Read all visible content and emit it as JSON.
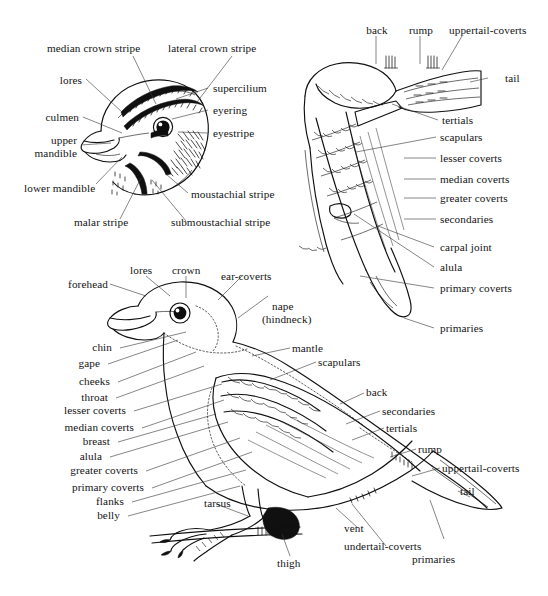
{
  "figure": {
    "kind": "bird-topography-diagram",
    "panels": [
      "head",
      "wing",
      "whole-body"
    ]
  },
  "head_panel": {
    "labels": [
      {
        "id": "median-crown-stripe",
        "text": "median crown stripe"
      },
      {
        "id": "lateral-crown-stripe",
        "text": "lateral crown stripe"
      },
      {
        "id": "lores",
        "text": "lores"
      },
      {
        "id": "supercilium",
        "text": "supercilium"
      },
      {
        "id": "culmen",
        "text": "culmen"
      },
      {
        "id": "eyering",
        "text": "eyering"
      },
      {
        "id": "eyestripe",
        "text": "eyestripe"
      },
      {
        "id": "upper-mandible",
        "text": "upper\nmandible"
      },
      {
        "id": "upper-mandible-l1",
        "text": "upper"
      },
      {
        "id": "upper-mandible-l2",
        "text": "mandible"
      },
      {
        "id": "lower-mandible",
        "text": "lower mandible"
      },
      {
        "id": "moustachial-stripe",
        "text": "moustachial stripe"
      },
      {
        "id": "malar-stripe",
        "text": "malar stripe"
      },
      {
        "id": "submoustachial-stripe",
        "text": "submoustachial stripe"
      }
    ]
  },
  "wing_panel": {
    "labels": [
      {
        "id": "back",
        "text": "back"
      },
      {
        "id": "rump",
        "text": "rump"
      },
      {
        "id": "uppertail-coverts",
        "text": "uppertail-coverts"
      },
      {
        "id": "tail",
        "text": "tail"
      },
      {
        "id": "tertials",
        "text": "tertials"
      },
      {
        "id": "scapulars",
        "text": "scapulars"
      },
      {
        "id": "lesser-coverts",
        "text": "lesser coverts"
      },
      {
        "id": "median-coverts",
        "text": "median coverts"
      },
      {
        "id": "greater-coverts",
        "text": "greater coverts"
      },
      {
        "id": "secondaries",
        "text": "secondaries"
      },
      {
        "id": "carpal-joint",
        "text": "carpal joint"
      },
      {
        "id": "alula",
        "text": "alula"
      },
      {
        "id": "primary-coverts",
        "text": "primary coverts"
      },
      {
        "id": "primaries",
        "text": "primaries"
      }
    ]
  },
  "body_panel": {
    "labels_top": [
      {
        "id": "lores",
        "text": "lores"
      },
      {
        "id": "crown",
        "text": "crown"
      },
      {
        "id": "forehead",
        "text": "forehead"
      },
      {
        "id": "ear-coverts",
        "text": "ear-coverts"
      },
      {
        "id": "nape-l1",
        "text": "nape"
      },
      {
        "id": "nape-l2",
        "text": "(hindneck)"
      }
    ],
    "labels_left": [
      {
        "id": "chin",
        "text": "chin"
      },
      {
        "id": "gape",
        "text": "gape"
      },
      {
        "id": "cheeks",
        "text": "cheeks"
      },
      {
        "id": "throat",
        "text": "throat"
      },
      {
        "id": "lesser-coverts",
        "text": "lesser coverts"
      },
      {
        "id": "median-coverts",
        "text": "median coverts"
      },
      {
        "id": "breast",
        "text": "breast"
      },
      {
        "id": "alula",
        "text": "alula"
      },
      {
        "id": "greater-coverts",
        "text": "greater coverts"
      },
      {
        "id": "primary-coverts",
        "text": "primary coverts"
      },
      {
        "id": "flanks",
        "text": "flanks"
      },
      {
        "id": "belly",
        "text": "belly"
      }
    ],
    "labels_right": [
      {
        "id": "mantle",
        "text": "mantle"
      },
      {
        "id": "scapulars",
        "text": "scapulars"
      },
      {
        "id": "back",
        "text": "back"
      },
      {
        "id": "secondaries",
        "text": "secondaries"
      },
      {
        "id": "tertials",
        "text": "tertials"
      },
      {
        "id": "rump",
        "text": "rump"
      },
      {
        "id": "uppertail-coverts",
        "text": "uppertail-coverts"
      },
      {
        "id": "tail",
        "text": "tail"
      },
      {
        "id": "primaries",
        "text": "primaries"
      }
    ],
    "labels_bottom": [
      {
        "id": "tarsus",
        "text": "tarsus"
      },
      {
        "id": "thigh",
        "text": "thigh"
      },
      {
        "id": "vent",
        "text": "vent"
      },
      {
        "id": "undertail-coverts",
        "text": "undertail-coverts"
      }
    ]
  }
}
